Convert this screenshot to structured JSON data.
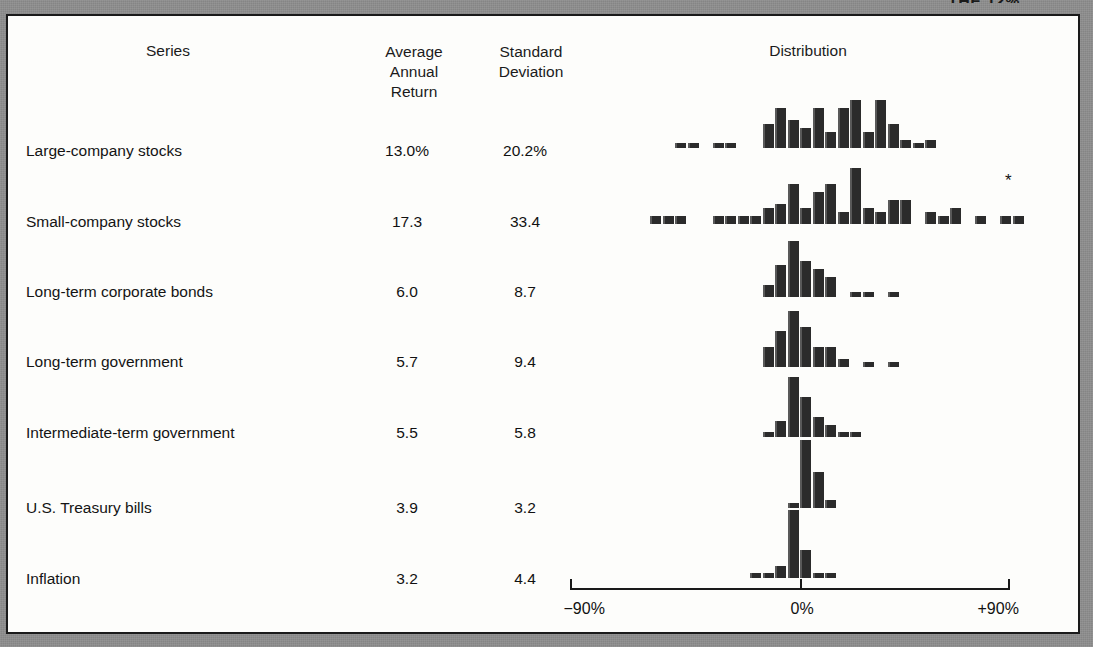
{
  "figure": {
    "cut_off_header": "THE 12%",
    "columns": {
      "series": "Series",
      "average_annual_return": "Average\nAnnual\nReturn",
      "average_annual_return_lines": [
        "Average",
        "Annual",
        "Return"
      ],
      "standard_deviation_lines": [
        "Standard",
        "Deviation"
      ],
      "distribution": "Distribution"
    },
    "axis": {
      "left_label": "−90%",
      "center_label": "0%",
      "right_label": "+90%",
      "min": -90,
      "max": 90,
      "ticks": [
        -90,
        0,
        90
      ]
    },
    "footnote_marker": "*"
  },
  "chart_data": {
    "type": "bar",
    "title": "Distribution",
    "xlabel": "",
    "ylabel": "",
    "xlim": [
      -90,
      90
    ],
    "grid": false,
    "legend": "none",
    "note": "Seven stacked histograms of annual total returns; bar height = frequency count per 5% return bin.",
    "columns": [
      "Series",
      "Average Annual Return",
      "Standard Deviation",
      "Distribution"
    ],
    "rows": [
      {
        "series": "Large-company stocks",
        "average_annual_return": "13.0%",
        "standard_deviation": "20.2%",
        "histogram": {
          "bin_width": 5,
          "bins": [
            -50,
            -45,
            -40,
            -35,
            -30,
            -25,
            -20,
            -15,
            -10,
            -5,
            0,
            5,
            10,
            15,
            20,
            25,
            30,
            35,
            40,
            45,
            50
          ],
          "counts": [
            1,
            1,
            0,
            1,
            1,
            0,
            0,
            6,
            10,
            7,
            5,
            10,
            4,
            10,
            12,
            4,
            12,
            6,
            2,
            1,
            2
          ]
        }
      },
      {
        "series": "Small-company stocks",
        "average_annual_return": "17.3",
        "standard_deviation": "33.4",
        "histogram": {
          "bin_width": 5,
          "bins": [
            -60,
            -55,
            -50,
            -45,
            -40,
            -35,
            -30,
            -25,
            -20,
            -15,
            -10,
            -5,
            0,
            5,
            10,
            15,
            20,
            25,
            30,
            35,
            40,
            45,
            50,
            55,
            60,
            65,
            70,
            75,
            80,
            85,
            90,
            95,
            100,
            105,
            110,
            115,
            120,
            125,
            130,
            135,
            140
          ],
          "counts": [
            2,
            2,
            2,
            0,
            0,
            2,
            2,
            2,
            2,
            4,
            5,
            10,
            4,
            8,
            10,
            3,
            14,
            4,
            3,
            6,
            6,
            0,
            3,
            2,
            4,
            0,
            2,
            0,
            2,
            2,
            0,
            0,
            0,
            0,
            0,
            0,
            0,
            0,
            0,
            0,
            0
          ]
        },
        "has_footnote_marker": true
      },
      {
        "series": "Long-term corporate bonds",
        "average_annual_return": "6.0",
        "standard_deviation": "8.7",
        "histogram": {
          "bin_width": 5,
          "bins": [
            -15,
            -10,
            -5,
            0,
            5,
            10,
            15,
            20,
            25,
            30,
            35,
            40,
            45
          ],
          "counts": [
            3,
            8,
            14,
            9,
            7,
            5,
            0,
            1,
            1,
            0,
            1,
            0,
            0
          ]
        }
      },
      {
        "series": "Long-term government",
        "average_annual_return": "5.7",
        "standard_deviation": "9.4",
        "histogram": {
          "bin_width": 5,
          "bins": [
            -15,
            -10,
            -5,
            0,
            5,
            10,
            15,
            20,
            25,
            30,
            35,
            40,
            45
          ],
          "counts": [
            5,
            9,
            14,
            10,
            5,
            5,
            2,
            0,
            1,
            0,
            1,
            0,
            0
          ]
        }
      },
      {
        "series": "Intermediate-term government",
        "average_annual_return": "5.5",
        "standard_deviation": "5.8",
        "histogram": {
          "bin_width": 5,
          "bins": [
            -15,
            -10,
            -5,
            0,
            5,
            10,
            15,
            20,
            25
          ],
          "counts": [
            1,
            4,
            15,
            10,
            5,
            3,
            1,
            1,
            0
          ]
        }
      },
      {
        "series": "U.S. Treasury bills",
        "average_annual_return": "3.9",
        "standard_deviation": "3.2",
        "histogram": {
          "bin_width": 5,
          "bins": [
            -5,
            0,
            5,
            10,
            15
          ],
          "counts": [
            1,
            17,
            9,
            2,
            0
          ]
        }
      },
      {
        "series": "Inflation",
        "average_annual_return": "3.2",
        "standard_deviation": "4.4",
        "histogram": {
          "bin_width": 5,
          "bins": [
            -20,
            -15,
            -10,
            -5,
            0,
            5,
            10,
            15
          ],
          "counts": [
            1,
            1,
            3,
            17,
            7,
            1,
            1,
            0
          ]
        }
      }
    ]
  },
  "layout": {
    "axis_x_min_px": 570,
    "axis_x_zero_px": 800,
    "axis_x_max_px": 1010,
    "row_baselines_px": [
      148,
      224,
      297,
      367,
      437,
      508,
      578
    ],
    "px_per_percent": 2.5,
    "bar_px_width": 11,
    "count_px_per_unit": 4.0
  }
}
